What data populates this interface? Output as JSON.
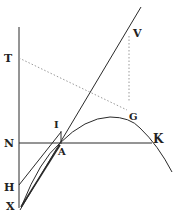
{
  "diagram": {
    "type": "geometric-figure",
    "colors": {
      "ink": "#2a2a2a",
      "dotted": "#9a9a9a",
      "background": "#ffffff"
    },
    "labels": {
      "T": "T",
      "V": "V",
      "I": "I",
      "G": "G",
      "N": "N",
      "A": "A",
      "K": "K",
      "H": "H",
      "X": "X"
    }
  }
}
